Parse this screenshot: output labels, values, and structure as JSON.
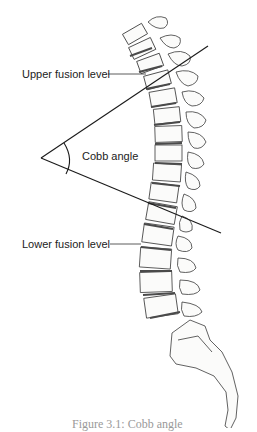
{
  "figure": {
    "labels": {
      "upper_fusion": "Upper fusion level",
      "cobb_angle": "Cobb angle",
      "lower_fusion": "Lower fusion level"
    },
    "caption": "Figure 3.1: Cobb angle",
    "colors": {
      "background": "#ffffff",
      "line": "#1a1a1a",
      "bone_fill": "#fbfbfa",
      "bone_stroke": "#3a3a3a",
      "disc": "#5a5a5a",
      "label_text": "#222222"
    },
    "cobb_lines": {
      "vertex": [
        41,
        158
      ],
      "upper_end": [
        208,
        46
      ],
      "lower_end": [
        221,
        233
      ]
    },
    "leaders": {
      "upper": [
        [
          108,
          74
        ],
        [
          146,
          74
        ]
      ],
      "lower": [
        [
          110,
          244
        ],
        [
          141,
          244
        ]
      ]
    }
  }
}
